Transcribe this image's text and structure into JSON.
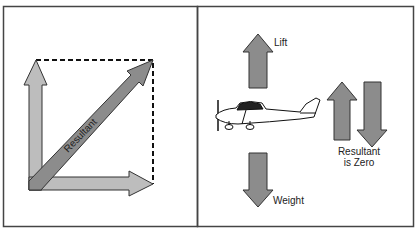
{
  "left_panel": {
    "resultant_label": "Resultant",
    "colors": {
      "light_arrow": "#bdbdbd",
      "dark_arrow": "#8c8c8c",
      "outline": "#333333"
    }
  },
  "right_panel": {
    "lift_label": "Lift",
    "weight_label": "Weight",
    "resultant_line1": "Resultant",
    "resultant_line2": "is Zero",
    "colors": {
      "arrow": "#8c8c8c",
      "outline": "#333333"
    }
  }
}
